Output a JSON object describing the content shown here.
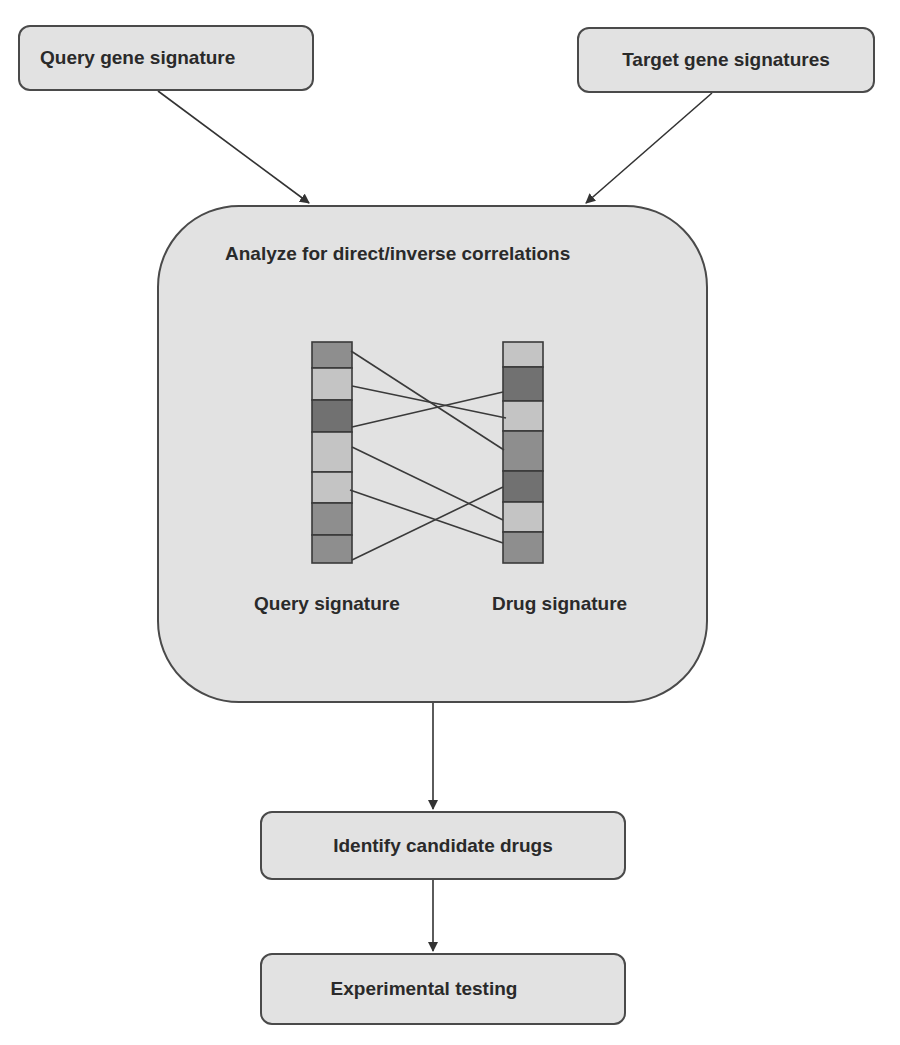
{
  "nodes": {
    "query_gene_signature": "Query gene signature",
    "target_gene_signatures": "Target gene signatures",
    "analyze": "Analyze for direct/inverse correlations",
    "identify_candidate_drugs": "Identify candidate drugs",
    "experimental_testing": "Experimental testing"
  },
  "analyze_panel": {
    "query_label": "Query signature",
    "drug_label": "Drug signature",
    "query_signature_cells": [
      "mid",
      "light",
      "dark",
      "light",
      "light",
      "mid",
      "mid"
    ],
    "drug_signature_cells": [
      "light",
      "dark",
      "light",
      "mid",
      "dark",
      "light",
      "mid"
    ],
    "connections": [
      {
        "from_query_row": 1,
        "to_drug_row": 4
      },
      {
        "from_query_row": 2,
        "to_drug_row": 3
      },
      {
        "from_query_row": 3,
        "to_drug_row": 2
      },
      {
        "from_query_row": 4,
        "to_drug_row": 6
      },
      {
        "from_query_row": 5,
        "to_drug_row": 7
      },
      {
        "from_query_row": 7,
        "to_drug_row": 5
      }
    ]
  },
  "edges": [
    {
      "from": "Query gene signature",
      "to": "Analyze for direct/inverse correlations"
    },
    {
      "from": "Target gene signatures",
      "to": "Analyze for direct/inverse correlations"
    },
    {
      "from": "Analyze for direct/inverse correlations",
      "to": "Identify candidate drugs"
    },
    {
      "from": "Identify candidate drugs",
      "to": "Experimental testing"
    }
  ],
  "colors": {
    "node_fill": "#e2e2e2",
    "node_border": "#4a4a4a",
    "text": "#2a2a2a",
    "cell_light": "#c4c4c4",
    "cell_mid": "#8e8e8e",
    "cell_dark": "#717171"
  }
}
